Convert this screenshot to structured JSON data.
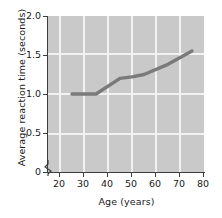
{
  "chart_data": {
    "type": "line",
    "title": "",
    "xlabel": "Age (years)",
    "ylabel": "Average reaction time (seconds)",
    "xlim": [
      15,
      80
    ],
    "ylim": [
      0,
      2.0
    ],
    "grid": true,
    "legend_position": "none",
    "x_ticks": [
      {
        "value": 20,
        "label": "20"
      },
      {
        "value": 30,
        "label": "30"
      },
      {
        "value": 40,
        "label": "40"
      },
      {
        "value": 50,
        "label": "50"
      },
      {
        "value": 60,
        "label": "60"
      },
      {
        "value": 70,
        "label": "70"
      },
      {
        "value": 80,
        "label": "80"
      }
    ],
    "y_ticks": [
      {
        "value": 2.0,
        "label": "2.0"
      },
      {
        "value": 1.5,
        "label": "1.5"
      },
      {
        "value": 1.0,
        "label": "1.0"
      },
      {
        "value": 0.5,
        "label": "0.5"
      },
      {
        "value": 0,
        "label": "0"
      }
    ],
    "axis_break": true,
    "series": [
      {
        "name": "Average reaction time",
        "color": "#7a7a7a",
        "x": [
          25,
          30,
          35,
          45,
          50,
          55,
          65,
          75
        ],
        "values": [
          1.0,
          1.0,
          1.0,
          1.2,
          1.22,
          1.25,
          1.38,
          1.55
        ]
      }
    ],
    "colors": {
      "plot_background": "#c9c9c9",
      "gridline": "#f2f2f2",
      "axis": "#3d3d3d",
      "line": "#7a7a7a",
      "text": "#1a1a1a",
      "page_background": "#ffffff"
    }
  }
}
